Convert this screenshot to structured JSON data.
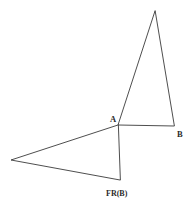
{
  "figure": {
    "background_color": "#ffffff",
    "stroke_color": "#3a3a3a",
    "label_color": "#2b2b2b",
    "width": 191,
    "height": 201
  },
  "labels": {
    "a": "A",
    "b": "B",
    "fr_b": "FR(B)"
  },
  "chart_data": {
    "type": "diagram",
    "xlabel": "",
    "ylabel": "",
    "xlim": [
      0,
      191
    ],
    "ylim": [
      0,
      201
    ],
    "grid": false,
    "legend": "none",
    "points": [
      {
        "name": "apex_top",
        "label": "",
        "x": 155,
        "y": 11
      },
      {
        "name": "A",
        "label": "A",
        "x": 118,
        "y": 125
      },
      {
        "name": "B",
        "label": "B",
        "x": 174,
        "y": 126
      },
      {
        "name": "apex_left",
        "label": "",
        "x": 11,
        "y": 160
      },
      {
        "name": "FR_B",
        "label": "FR(B)",
        "x": 120,
        "y": 180
      }
    ],
    "shapes": [
      {
        "name": "upper-triangle",
        "type": "polygon",
        "vertices": [
          [
            155,
            11
          ],
          [
            118,
            125
          ],
          [
            174,
            126
          ]
        ],
        "closed": true
      },
      {
        "name": "lower-triangle",
        "type": "polygon",
        "vertices": [
          [
            118,
            125
          ],
          [
            11,
            160
          ],
          [
            120,
            180
          ]
        ],
        "closed": true
      }
    ],
    "label_positions": [
      {
        "name": "A",
        "text": "A",
        "x": 110,
        "y": 122
      },
      {
        "name": "B",
        "text": "B",
        "x": 177,
        "y": 137
      },
      {
        "name": "FR(B)",
        "text": "FR(B)",
        "x": 106,
        "y": 196
      }
    ]
  }
}
